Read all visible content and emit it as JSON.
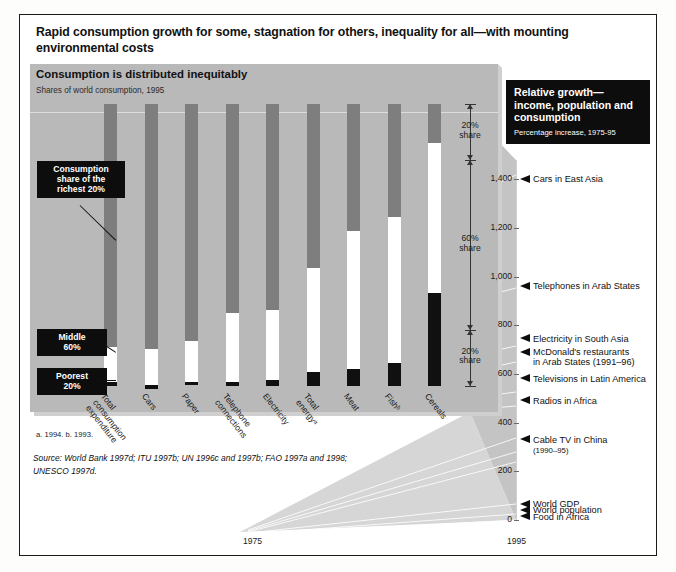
{
  "headline": "Rapid consumption growth for some, stagnation for others, inequality for all—with mounting environmental costs",
  "left_panel": {
    "title": "Consumption is distributed inequitably",
    "subtitle": "Shares of world consumption, 1995",
    "callouts": {
      "rich": "Consumption\nshare of the\nrichest 20%",
      "middle": "Middle\n60%",
      "poorest": "Poorest\n20%"
    },
    "brackets": [
      {
        "label": "20%\nshare"
      },
      {
        "label": "60%\nshare"
      },
      {
        "label": "20%\nshare"
      }
    ],
    "footnote": "a. 1994.  b. 1993.",
    "source": "Source: World Bank 1997d; ITU 1997b; UN 1996c and 1997b; FAO 1997a and 1998; UNESCO 1997d."
  },
  "right_panel": {
    "title": "Relative growth—income, population and consumption",
    "subtitle": "Percentage increase, 1975-95",
    "axis": {
      "ticks": [
        "1,400",
        "1,200",
        "1,000",
        "800",
        "600",
        "400",
        "200",
        "0"
      ],
      "x_start": "1975",
      "x_end": "1995"
    },
    "markers": [
      {
        "label": "Cars in East Asia",
        "value": 1400
      },
      {
        "label": "Telephones in Arab States",
        "value": 960
      },
      {
        "label": "Electricity in South Asia",
        "value": 745
      },
      {
        "label": "McDonald's restaurants",
        "label2": "in Arab States",
        "note": "(1991–96)",
        "value": 690
      },
      {
        "label": "Televisions in Latin America",
        "value": 580
      },
      {
        "label": "Radios in Africa",
        "value": 490
      },
      {
        "label": "Cable TV in China",
        "note2": "(1990–95)",
        "value": 330
      },
      {
        "label": "World GDP",
        "value": 65
      },
      {
        "label": "World population",
        "value": 40
      },
      {
        "label": "Food in Africa",
        "value": 12
      }
    ]
  },
  "chart_data": {
    "type": "bar",
    "title": "Consumption is distributed inequitably",
    "subtitle": "Shares of world consumption, 1995",
    "stacked": true,
    "ylabel": "Share of world consumption (%)",
    "ylim": [
      0,
      100
    ],
    "categories": [
      "Total consumption expenditure",
      "Cars",
      "Paper",
      "Telephone connections",
      "Electricity",
      "Total energyᵃ",
      "Meat",
      "Fishᵇ",
      "Cereals"
    ],
    "series": [
      {
        "name": "Richest 20%",
        "color": "#7e7e7e",
        "values": [
          86,
          87,
          84,
          74,
          73,
          58,
          45,
          40,
          14
        ]
      },
      {
        "name": "Middle 60%",
        "color": "#ffffff",
        "values": [
          12.7,
          12.7,
          14.5,
          24.5,
          24.8,
          37,
          49,
          52,
          53
        ]
      },
      {
        "name": "Poorest 20%",
        "color": "#101010",
        "values": [
          1.3,
          1.3,
          1.1,
          1.5,
          2.2,
          5,
          6,
          8,
          33
        ]
      }
    ],
    "brackets": [
      "20% share",
      "60% share",
      "20% share"
    ]
  },
  "growth_chart": {
    "type": "line",
    "title": "Relative growth—income, population and consumption",
    "subtitle": "Percentage increase, 1975-95",
    "xlabel": "",
    "x": [
      1975,
      1995
    ],
    "ylim": [
      0,
      1480
    ],
    "yticks": [
      0,
      200,
      400,
      600,
      800,
      1000,
      1200,
      1400
    ],
    "series": [
      {
        "name": "Cars in East Asia",
        "end_value": 1400
      },
      {
        "name": "Telephones in Arab States",
        "end_value": 960
      },
      {
        "name": "Electricity in South Asia",
        "end_value": 745
      },
      {
        "name": "McDonald's restaurants in Arab States (1991–96)",
        "end_value": 690
      },
      {
        "name": "Televisions in Latin America",
        "end_value": 580
      },
      {
        "name": "Radios in Africa",
        "end_value": 490
      },
      {
        "name": "Cable TV in China (1990–95)",
        "end_value": 330
      },
      {
        "name": "World GDP",
        "end_value": 65
      },
      {
        "name": "World population",
        "end_value": 40
      },
      {
        "name": "Food in Africa",
        "end_value": 12
      }
    ]
  }
}
